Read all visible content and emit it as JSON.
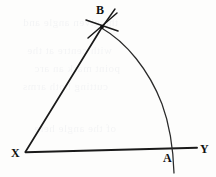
{
  "figure": {
    "background_color": "#fdfdfc",
    "ink_color": "#1a1a1a",
    "width": 216,
    "height": 177
  },
  "labels": {
    "vertex_x": "X",
    "vertex_b": "B",
    "point_a": "A",
    "ray_end_y": "Y"
  },
  "geometry": {
    "points": {
      "X": {
        "x": 25,
        "y": 152
      },
      "B": {
        "x": 102,
        "y": 27
      },
      "A": {
        "x": 173,
        "y": 149
      },
      "Y_end": {
        "x": 197,
        "y": 148
      }
    },
    "segments": [
      {
        "name": "ray-xb",
        "from": "X",
        "to": "B"
      },
      {
        "name": "ray-xy",
        "from": "X",
        "to": "Y_end"
      }
    ],
    "arc": {
      "name": "arc-b-to-a",
      "from": "B",
      "to": "A",
      "tail_end": {
        "x": 174,
        "y": 173
      },
      "description": "compass arc centred at X sweeping from B down through A"
    },
    "construction_marks": {
      "name": "intersecting-arc-ticks-at-B",
      "count": 2,
      "description": "two short crossing compass strokes marking the intersection point B"
    }
  },
  "bleed_text": {
    "opacity": 0.045,
    "lines": [
      "the given angle and",
      "with centre at the",
      "point mark an arc",
      "cutting both arms",
      "of the angle here"
    ]
  }
}
